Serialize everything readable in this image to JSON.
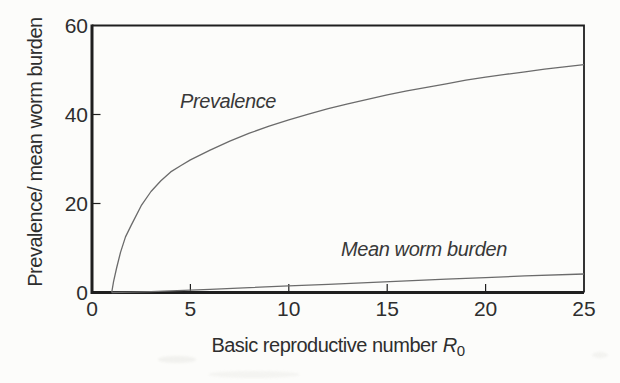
{
  "figure": {
    "background": "#fcfcfa",
    "chart_data": {
      "type": "line",
      "title": "",
      "xlabel": "Basic reproductive number R0",
      "xlabel_main": "Basic reproductive number",
      "xlabel_symbol": "R",
      "xlabel_sub": "0",
      "ylabel": "Prevalence/ mean worm burden",
      "xlim": [
        0,
        25
      ],
      "ylim": [
        0,
        60
      ],
      "x_ticks": [
        0,
        5,
        10,
        15,
        20,
        25
      ],
      "y_ticks": [
        0,
        20,
        40,
        60
      ],
      "grid": false,
      "frame": "box",
      "legend_position": "inline-labels",
      "axis_color": "#1f1f1f",
      "line_color": "#6b6b6b",
      "text_color": "#2e2e2e",
      "series": [
        {
          "name": "Prevalence",
          "label_anchor": {
            "x_px": 180,
            "y_px": 108
          },
          "x": [
            1,
            1.1,
            1.25,
            1.45,
            1.7,
            2,
            2.5,
            3,
            3.5,
            4,
            4.5,
            5,
            6,
            7,
            8,
            9,
            10,
            11,
            12,
            13,
            14,
            15,
            16,
            17,
            18,
            19,
            20,
            21,
            22,
            23,
            24,
            25
          ],
          "y": [
            0,
            2.5,
            5.5,
            9,
            12.5,
            15.2,
            19.5,
            22.7,
            25.1,
            27.1,
            28.5,
            29.8,
            32,
            34,
            35.8,
            37.4,
            38.8,
            40.1,
            41.3,
            42.4,
            43.4,
            44.4,
            45.3,
            46.1,
            46.9,
            47.7,
            48.4,
            49,
            49.6,
            50.2,
            50.7,
            51.2
          ]
        },
        {
          "name": "Mean worm burden",
          "label_anchor": {
            "x_px": 341,
            "y_px": 256
          },
          "x": [
            1,
            2,
            3,
            4,
            5,
            6,
            8,
            10,
            12,
            14,
            16,
            18,
            20,
            22,
            25
          ],
          "y": [
            0,
            0.08,
            0.2,
            0.36,
            0.54,
            0.72,
            1.1,
            1.48,
            1.85,
            2.23,
            2.6,
            2.98,
            3.35,
            3.72,
            4.15
          ]
        }
      ]
    }
  }
}
